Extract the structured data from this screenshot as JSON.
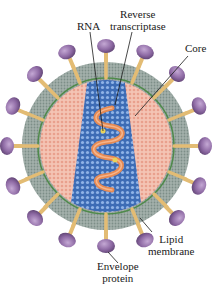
{
  "diagram": {
    "labels": {
      "rna": "RNA",
      "reverse_transcriptase_line1": "Reverse",
      "reverse_transcriptase_line2": "transcriptase",
      "core": "Core",
      "lipid_membrane_line1": "Lipid",
      "lipid_membrane_line2": "membrane",
      "envelope_protein_line1": "Envelope",
      "envelope_protein_line2": "protein"
    },
    "colors": {
      "envelope_protein": "#8a6a9e",
      "envelope_stalk": "#e0b870",
      "lipid_membrane": "#9aa8a2",
      "membrane_inner_line": "#4f8a4a",
      "matrix": "#f2b7a6",
      "core": "#3f6fb8",
      "rna": "#e88a55",
      "enzyme": "#e8d25a"
    }
  }
}
